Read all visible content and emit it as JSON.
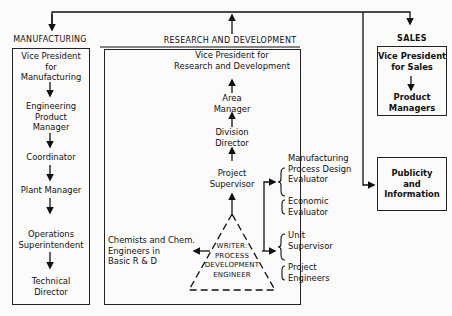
{
  "departments": {
    "manufacturing": {
      "header": "MANUFACTURING",
      "roles": [
        "Vice President for Manufacturing",
        "Engineering Product Manager",
        "Coordinator",
        "Plant Manager",
        "Operations Superintendent",
        "Technical Director"
      ],
      "lines": {
        "vp": [
          "Vice President",
          "for",
          "Manufacturing"
        ],
        "epm": [
          "Engineering",
          "Product",
          "Manager"
        ],
        "coord": "Coordinator",
        "plant": "Plant Manager",
        "ops": [
          "Operations",
          "Superintendent"
        ],
        "tech": [
          "Technical",
          "Director"
        ]
      }
    },
    "research": {
      "header": "RESEARCH AND DEVELOPMENT",
      "vp": [
        "Vice President for",
        "Research and Development"
      ],
      "area": [
        "Area",
        "Manager"
      ],
      "division": [
        "Division",
        "Director"
      ],
      "project_supervisor": [
        "Project",
        "Supervisor"
      ],
      "chemists": [
        "Chemists and Chem.",
        "Engineers in",
        "Basic R & D"
      ],
      "writer": [
        "WRITER:",
        "PROCESS",
        "DEVELOPMENT",
        "ENGINEER"
      ],
      "mpde": [
        "Manufacturing",
        "Process Design",
        "Evaluator"
      ],
      "economic": [
        "Economic",
        "Evaluator"
      ],
      "unit": [
        "Unit",
        "Supervisor"
      ],
      "project_engineers": [
        "Project",
        "Engineers"
      ]
    },
    "sales": {
      "header": "SALES",
      "vp": [
        "Vice President",
        "for Sales"
      ],
      "pm": [
        "Product",
        "Managers"
      ]
    },
    "publicity": {
      "label": [
        "Publicity",
        "and",
        "Information"
      ]
    }
  },
  "colors": {
    "line": "#111111",
    "background": "#fbfbf9"
  }
}
